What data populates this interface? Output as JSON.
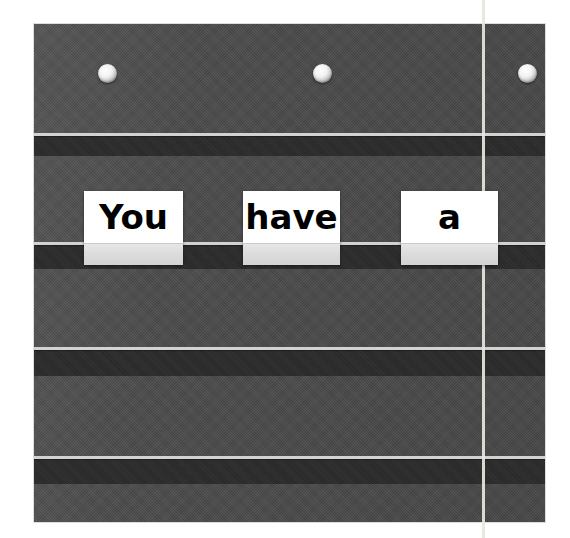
{
  "scene": {
    "name": "classroom pocket chart",
    "sentence": "You have a",
    "background_color": "#ffffff"
  },
  "chart": {
    "fabric_color": "#4a4a4a",
    "band_color": "#2b2b2b",
    "rail_line_color": "#d2d2cf",
    "frame": {
      "left": 34,
      "top": 24,
      "width": 511,
      "height": 498
    },
    "grommets": [
      {
        "name": "grommet-left",
        "x": 64,
        "y": 40
      },
      {
        "name": "grommet-center",
        "x": 279,
        "y": 40
      },
      {
        "name": "grommet-right",
        "x": 484,
        "y": 40
      }
    ],
    "rails": [
      {
        "name": "pocket-rail-1",
        "line_y": 133,
        "band_y": 136,
        "band_height": 20
      },
      {
        "name": "pocket-rail-2",
        "line_y": 242,
        "band_y": 245,
        "band_height": 24
      },
      {
        "name": "pocket-rail-3",
        "line_y": 347,
        "band_y": 350,
        "band_height": 26
      },
      {
        "name": "pocket-rail-4",
        "line_y": 456,
        "band_y": 459,
        "band_height": 25
      }
    ],
    "vertical_line": {
      "name": "vertical-strap-line",
      "x": 482,
      "color": "#e7e7e2"
    }
  },
  "cards": [
    {
      "word": "You",
      "color": "#ffffff",
      "text_color": "#000000",
      "tuck_color": "#dcdcdc",
      "left": 84,
      "top": 191,
      "width": 99,
      "height": 74,
      "tuck_top": 52
    },
    {
      "word": "have",
      "color": "#ffffff",
      "text_color": "#000000",
      "tuck_color": "#dcdcdc",
      "left": 243,
      "top": 191,
      "width": 97,
      "height": 74,
      "tuck_top": 52
    },
    {
      "word": "a",
      "color": "#ffffff",
      "text_color": "#000000",
      "tuck_color": "#dcdcdc",
      "left": 401,
      "top": 191,
      "width": 97,
      "height": 74,
      "tuck_top": 52
    }
  ]
}
